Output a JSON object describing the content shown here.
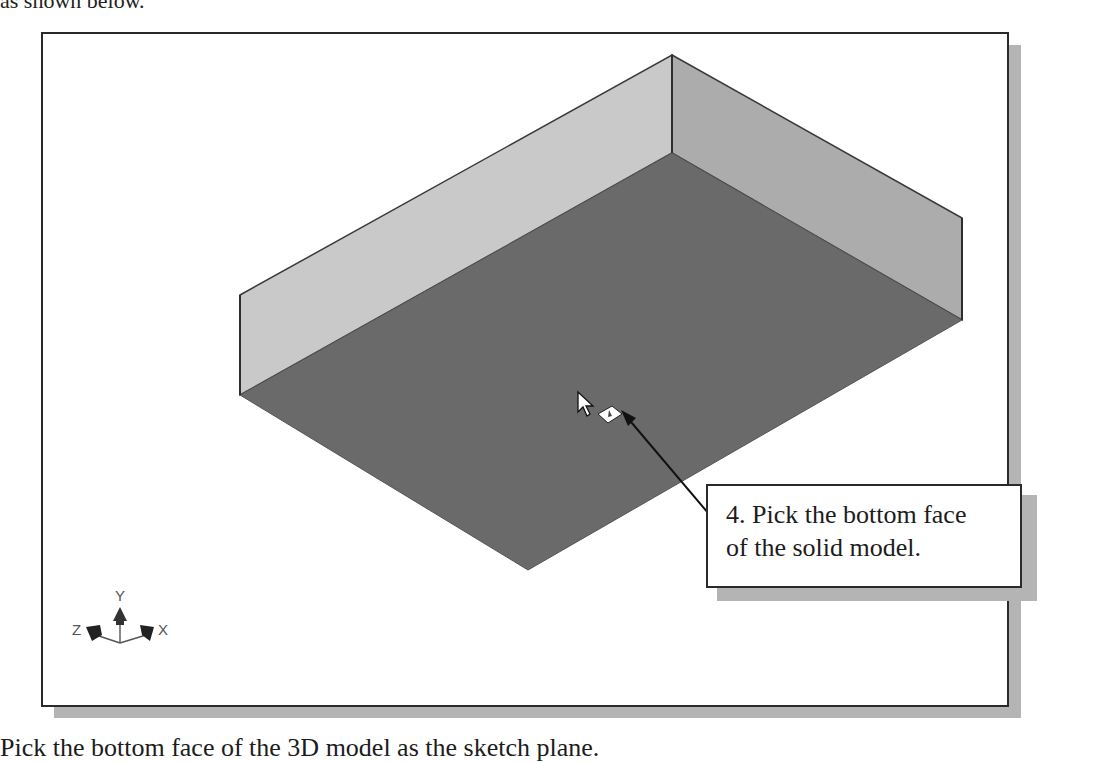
{
  "document": {
    "top_caption": "as shown below.",
    "bottom_caption": "Pick the bottom face of the 3D model as the sketch plane."
  },
  "viewport": {
    "background": "#ffffff",
    "frame_border": "#2a2a2a",
    "shadow": "#b4b4b4"
  },
  "model": {
    "name": "solid-box",
    "colors": {
      "bottom_face": "#6a6a6a",
      "left_wall": "#c8c8c8",
      "right_wall": "#adadad",
      "edge": "#3a3a3a"
    }
  },
  "callout": {
    "step": "4.",
    "line1": "4. Pick the bottom face",
    "line2": "of the solid model."
  },
  "triad": {
    "x_label": "X",
    "y_label": "Y",
    "z_label": "Z"
  }
}
